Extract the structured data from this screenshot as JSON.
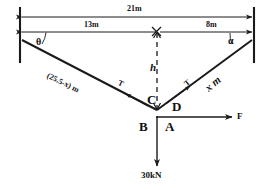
{
  "figure": {
    "stroke_color": "#1a1a1a",
    "background_color": "#ffffff"
  },
  "dimensions": {
    "total_span": "21m",
    "left_segment": "13m",
    "right_segment": "8m",
    "height_symbol": "h"
  },
  "angles": {
    "left": "θ",
    "right": "α"
  },
  "members": {
    "left_label": "(25.5-x) m",
    "right_label": "x m",
    "left_tension": "T",
    "right_tension": "T"
  },
  "nodes": {
    "upper_left_of_joint": "C",
    "upper_right_of_joint": "D",
    "lower_left_of_joint": "B",
    "lower_right_of_joint": "A"
  },
  "forces": {
    "horizontal_label": "F",
    "vertical_label": "30kN"
  }
}
